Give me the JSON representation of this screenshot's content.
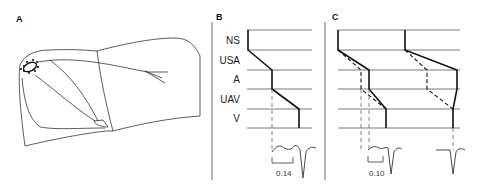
{
  "panels": {
    "a": {
      "label": "A"
    },
    "b": {
      "label": "B",
      "rows": [
        "NS",
        "USA",
        "A",
        "UAV",
        "V"
      ],
      "interval_label": "0.14"
    },
    "c": {
      "label": "C",
      "interval_label": "0.10"
    }
  },
  "colors": {
    "line": "#222222",
    "thin": "#555555"
  }
}
